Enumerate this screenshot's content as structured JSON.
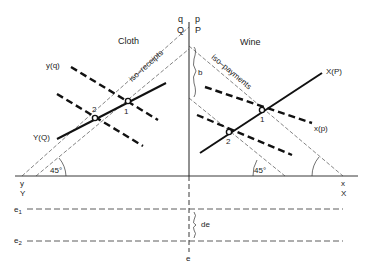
{
  "diagram": {
    "type": "economics trade diagram",
    "panels": {
      "left": {
        "title": "Cloth"
      },
      "right": {
        "title": "Wine"
      }
    },
    "axis_labels": {
      "top_left_lower": "q",
      "top_left_upper": "Q",
      "top_right_lower": "p",
      "top_right_upper": "P",
      "left_lower": "y",
      "left_upper": "Y",
      "right_lower": "x",
      "right_upper": "X",
      "bottom": "e"
    },
    "curves": {
      "left_dashed_upper": "y(q)",
      "left_solid": "Y(Q)",
      "right_solid": "X(P)",
      "right_dashed_upper": "x(p)"
    },
    "iso_lines": {
      "left": "iso–receipts",
      "right": "iso–payments"
    },
    "points": {
      "left_point_1": "1",
      "left_point_2": "2",
      "right_point_1": "1",
      "right_point_2": "2"
    },
    "angles": {
      "left": "45°",
      "right": "45°"
    },
    "brace_labels": {
      "vertical_gap": "b",
      "exchange_gap": "de"
    },
    "exchange_levels": {
      "e1": {
        "base": "e",
        "sub": "1"
      },
      "e2": {
        "base": "e",
        "sub": "2"
      }
    }
  }
}
